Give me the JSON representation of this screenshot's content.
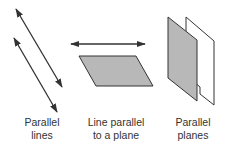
{
  "figures": [
    {
      "id": "parallel-lines",
      "label_line1": "Parallel",
      "label_line2": "lines"
    },
    {
      "id": "line-parallel-plane",
      "label_line1": "Line parallel",
      "label_line2": "to a plane"
    },
    {
      "id": "parallel-planes",
      "label_line1": "Parallel",
      "label_line2": "planes"
    }
  ],
  "colors": {
    "stroke": "#333333",
    "plane_gray": "#b8b8b8",
    "plane_white": "#ffffff",
    "text": "#333333"
  }
}
